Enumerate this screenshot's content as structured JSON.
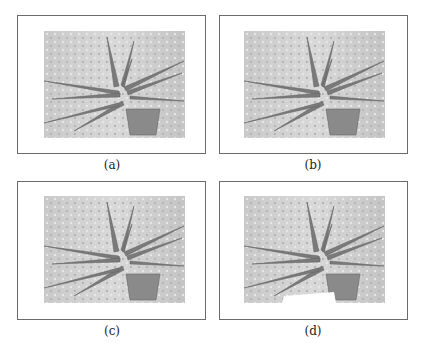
{
  "figure": {
    "panels": [
      {
        "id": "a",
        "caption": "(a)",
        "variant": "original"
      },
      {
        "id": "b",
        "caption": "(b)",
        "variant": "processed-1"
      },
      {
        "id": "c",
        "caption": "(c)",
        "variant": "processed-2"
      },
      {
        "id": "d",
        "caption": "(d)",
        "variant": "processed-3"
      }
    ]
  }
}
